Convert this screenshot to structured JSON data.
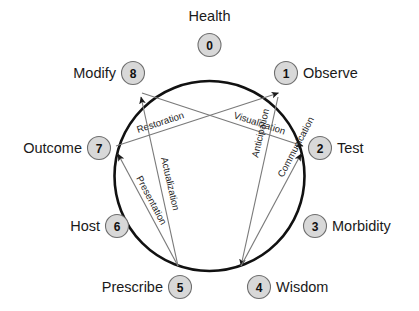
{
  "diagram": {
    "shape": "circle",
    "colors": {
      "ring_stroke": "#111111",
      "node_fill": "#d8d8d8",
      "node_stroke": "#6e6e6e",
      "edge_stroke": "#7a7a7a",
      "text": "#1a1a1a",
      "background": "#ffffff"
    },
    "nodes": [
      {
        "number": "0",
        "label": "Health",
        "label_side": "above"
      },
      {
        "number": "1",
        "label": "Observe",
        "label_side": "right"
      },
      {
        "number": "2",
        "label": "Test",
        "label_side": "right"
      },
      {
        "number": "3",
        "label": "Morbidity",
        "label_side": "right"
      },
      {
        "number": "4",
        "label": "Wisdom",
        "label_side": "right"
      },
      {
        "number": "5",
        "label": "Prescribe",
        "label_side": "left"
      },
      {
        "number": "6",
        "label": "Host",
        "label_side": "left"
      },
      {
        "number": "7",
        "label": "Outcome",
        "label_side": "left"
      },
      {
        "number": "8",
        "label": "Modify",
        "label_side": "left"
      }
    ],
    "edges": [
      {
        "label": "Restoration",
        "from": "7",
        "to": "1"
      },
      {
        "label": "Visualization",
        "from": "8",
        "to": "2"
      },
      {
        "label": "Presentation",
        "from": "5",
        "to": "7"
      },
      {
        "label": "Actualization",
        "from": "5",
        "to": "8"
      },
      {
        "label": "Anticipation",
        "from": "1",
        "to": "4"
      },
      {
        "label": "Communication",
        "from": "2",
        "to": "4"
      }
    ]
  }
}
